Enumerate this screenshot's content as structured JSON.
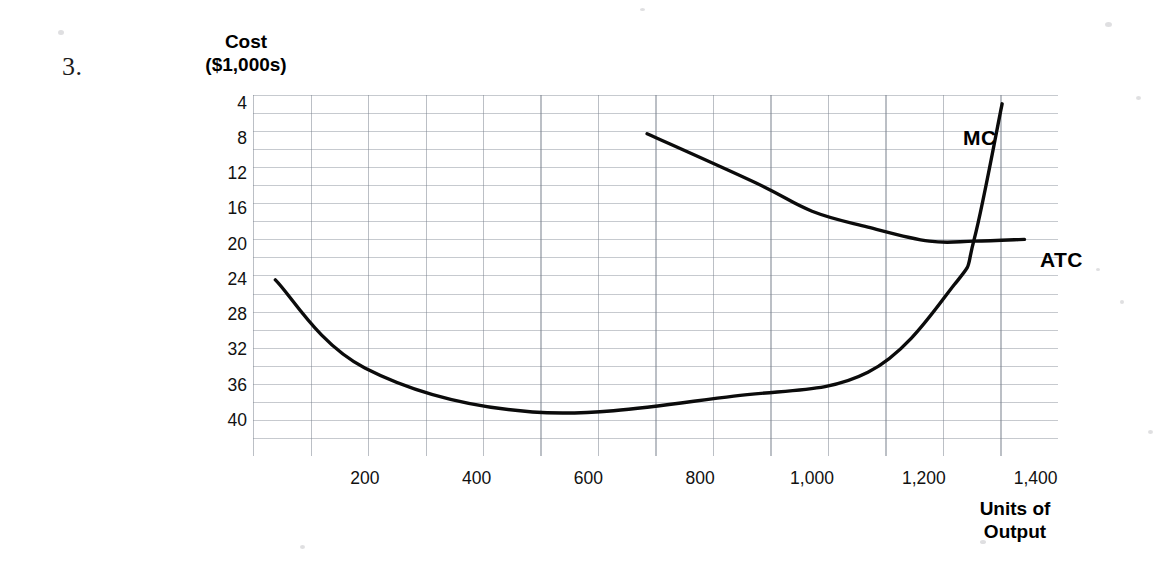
{
  "question_number": "3.",
  "axes": {
    "y_title_line1": "Cost",
    "y_title_line2": "($1,000s)",
    "x_title_line1": "Units of",
    "x_title_line2": "Output",
    "y_ticks": [
      "40",
      "36",
      "32",
      "28",
      "24",
      "20",
      "16",
      "12",
      "8",
      "4"
    ],
    "x_ticks": [
      "200",
      "400",
      "600",
      "800",
      "1,000",
      "1,200",
      "1,400"
    ]
  },
  "annotations": {
    "mc_label": "MC",
    "atc_label": "ATC"
  },
  "colors": {
    "curve": "#0b0b0b",
    "grid": "#78808c",
    "text": "#111111",
    "background": "#ffffff"
  },
  "chart_data": {
    "type": "line",
    "title": "",
    "xlabel": "Units of Output",
    "ylabel": "Cost ($1,000s)",
    "xlim": [
      0,
      1440
    ],
    "ylim": [
      0,
      41
    ],
    "y_ticks": [
      4,
      8,
      12,
      16,
      20,
      24,
      28,
      32,
      36,
      40
    ],
    "x_ticks": [
      200,
      400,
      600,
      800,
      1000,
      1200,
      1400
    ],
    "grid": true,
    "grid_x_step": 100,
    "grid_y_step": 2,
    "legend": "inline-annotations",
    "series": [
      {
        "name": "MC",
        "label_position": {
          "x": 1240,
          "y": 35.5
        },
        "points": [
          {
            "x": 40,
            "y": 20.0
          },
          {
            "x": 200,
            "y": 10.0
          },
          {
            "x": 500,
            "y": 5.0
          },
          {
            "x": 860,
            "y": 6.8
          },
          {
            "x": 1100,
            "y": 9.5
          },
          {
            "x": 1255,
            "y": 19.5
          },
          {
            "x": 1290,
            "y": 24.6
          },
          {
            "x": 1340,
            "y": 40.0
          }
        ]
      },
      {
        "name": "ATC",
        "label_position": {
          "x": 1375,
          "y": 22.5
        },
        "points": [
          {
            "x": 705,
            "y": 36.6
          },
          {
            "x": 900,
            "y": 31.0
          },
          {
            "x": 1000,
            "y": 27.8
          },
          {
            "x": 1100,
            "y": 26.0
          },
          {
            "x": 1210,
            "y": 24.4
          },
          {
            "x": 1290,
            "y": 24.4
          },
          {
            "x": 1380,
            "y": 24.6
          }
        ]
      }
    ]
  }
}
